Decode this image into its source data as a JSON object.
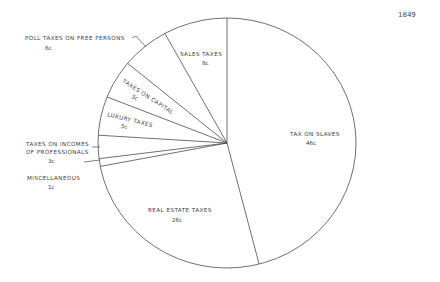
{
  "chart_data": {
    "type": "pie",
    "title": "1849",
    "unit": "cents per dollar of revenue",
    "direction": "clockwise from top",
    "categories": [
      "TAX ON SLAVES",
      "REAL ESTATE TAXES",
      "MISCELLANEOUS",
      "TAXES ON INCOMES OF PROFESSIONALS",
      "LUXURY TAXES",
      "TAXES ON CAPITAL",
      "POLL TAXES ON FREE PERSONS",
      "SALES TAXES"
    ],
    "values": [
      46,
      26,
      1,
      3,
      5,
      5,
      6,
      8
    ],
    "value_labels": [
      "46c",
      "26c",
      "1c",
      "3c",
      "5c",
      "5c",
      "6c",
      "8c"
    ],
    "legend": "none (labels placed on/next to slices)",
    "colors": {
      "background": "#ffffff",
      "lines": "#4a4a4a",
      "text": "#3c3c3c"
    }
  },
  "labels": {
    "title": "1849",
    "slaves": {
      "name": "TAX ON SLAVES",
      "value": "46c"
    },
    "real_estate": {
      "name": "REAL ESTATE TAXES",
      "value": "26c"
    },
    "misc": {
      "name": "MISCELLANEOUS",
      "value": "1c"
    },
    "professionals": {
      "line1": "TAXES ON INCOMES",
      "line2": "OF PROFESSIONALS",
      "value": "3c"
    },
    "luxury": {
      "name": "LUXURY TAXES",
      "value": "5c"
    },
    "capital": {
      "name": "TAXES ON CAPITAL",
      "value": "5c"
    },
    "poll": {
      "name": "POLL TAXES ON FREE PERSONS",
      "value": "6c"
    },
    "sales": {
      "name": "SALES TAXES",
      "value": "8c"
    }
  }
}
